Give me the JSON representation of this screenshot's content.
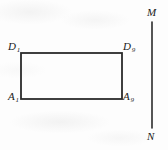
{
  "figure": {
    "background_color": "#fdfdfd",
    "stroke_color": "#2b2b2b",
    "label_color": "#1a1a1a",
    "rectangle": {
      "name": "rectangle-A1-A9-D9-D1",
      "left": 21,
      "top": 53,
      "right": 122,
      "bottom": 99,
      "stroke_width": 1.8
    },
    "line_mn": {
      "name": "segment-MN",
      "x": 152,
      "y_top": 22,
      "y_bottom": 128,
      "stroke_width": 1.6
    },
    "labels": {
      "top_left": {
        "base": "D",
        "sub": "1",
        "full": "D1"
      },
      "top_right": {
        "base": "D",
        "sub": "9",
        "full": "D9"
      },
      "bottom_left": {
        "base": "A",
        "sub": "1",
        "full": "A1"
      },
      "bottom_right": {
        "base": "A",
        "sub": "9",
        "full": "A9"
      },
      "line_top": "M",
      "line_bottom": "N"
    }
  }
}
